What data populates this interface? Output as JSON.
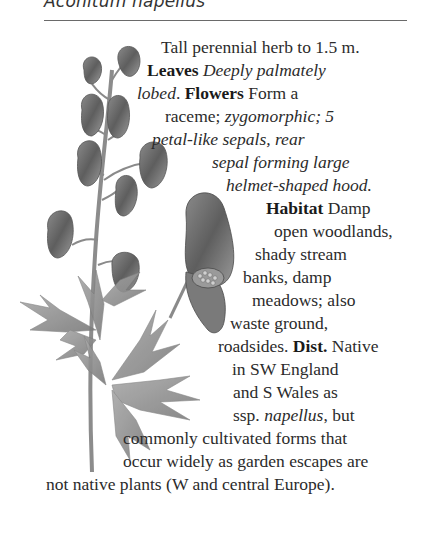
{
  "page": {
    "species_heading": "Aconitum napellus",
    "illustration": {
      "name": "monkshood-illustration",
      "description": "Botanical pencil drawing of Aconitum napellus: flowering raceme of helmet-shaped flowers, enlarged single flower, and deeply lobed leaves on stem"
    },
    "description": {
      "intro": "Tall perennial herb to 1.5 m.",
      "leaves_label": "Leaves",
      "leaves_text": "Deeply palmately lobed.",
      "flowers_label": "Flowers",
      "flowers_text_plain": "Form a raceme;",
      "flowers_text_italic": "zygomorphic; 5 petal-like sepals, rear sepal forming large helmet-shaped hood.",
      "habitat_label": "Habitat",
      "habitat_text": "Damp open woodlands, shady stream banks, damp meadows; also waste ground, roadsides.",
      "dist_label": "Dist.",
      "dist_text": "Native in SW England and S Wales as ssp. napellus, but commonly cultivated forms that occur widely as garden escapes are not native plants (W and central Europe)."
    },
    "lines": [
      {
        "segments": [
          {
            "t": "Tall perennial herb to 1.5 m.",
            "s": "n"
          }
        ]
      },
      {
        "segments": [
          {
            "t": "Leaves",
            "s": "b"
          },
          {
            "t": " Deeply palmately",
            "s": "i"
          }
        ]
      },
      {
        "segments": [
          {
            "t": "lobed",
            "s": "i"
          },
          {
            "t": ". ",
            "s": "n"
          },
          {
            "t": "Flowers",
            "s": "b"
          },
          {
            "t": " Form a",
            "s": "n"
          }
        ]
      },
      {
        "segments": [
          {
            "t": "raceme; ",
            "s": "n"
          },
          {
            "t": "zygomorphic; 5",
            "s": "i"
          }
        ]
      },
      {
        "segments": [
          {
            "t": "petal-like sepals, rear",
            "s": "i"
          }
        ]
      },
      {
        "segments": [
          {
            "t": "sepal forming large",
            "s": "i"
          }
        ]
      },
      {
        "segments": [
          {
            "t": "helmet-shaped hood.",
            "s": "i"
          }
        ]
      },
      {
        "segments": [
          {
            "t": "Habitat",
            "s": "b"
          },
          {
            "t": " Damp",
            "s": "n"
          }
        ]
      },
      {
        "segments": [
          {
            "t": "open woodlands,",
            "s": "n"
          }
        ]
      },
      {
        "segments": [
          {
            "t": "shady stream",
            "s": "n"
          }
        ]
      },
      {
        "segments": [
          {
            "t": "banks, damp",
            "s": "n"
          }
        ]
      },
      {
        "segments": [
          {
            "t": "meadows; also",
            "s": "n"
          }
        ]
      },
      {
        "segments": [
          {
            "t": "waste ground,",
            "s": "n"
          }
        ]
      },
      {
        "segments": [
          {
            "t": "roadsides. ",
            "s": "n"
          },
          {
            "t": "Dist.",
            "s": "b"
          },
          {
            "t": " Native",
            "s": "n"
          }
        ]
      },
      {
        "segments": [
          {
            "t": "in SW England",
            "s": "n"
          }
        ]
      },
      {
        "segments": [
          {
            "t": "and S Wales as",
            "s": "n"
          }
        ]
      },
      {
        "segments": [
          {
            "t": "ssp. ",
            "s": "n"
          },
          {
            "t": "napellus",
            "s": "i"
          },
          {
            "t": ", but",
            "s": "n"
          }
        ]
      },
      {
        "segments": [
          {
            "t": "commonly cultivated forms that",
            "s": "n"
          }
        ]
      },
      {
        "segments": [
          {
            "t": "occur widely as garden escapes are",
            "s": "n"
          }
        ]
      },
      {
        "segments": [
          {
            "t": "not native plants (W and central Europe).",
            "s": "n"
          }
        ]
      }
    ]
  }
}
